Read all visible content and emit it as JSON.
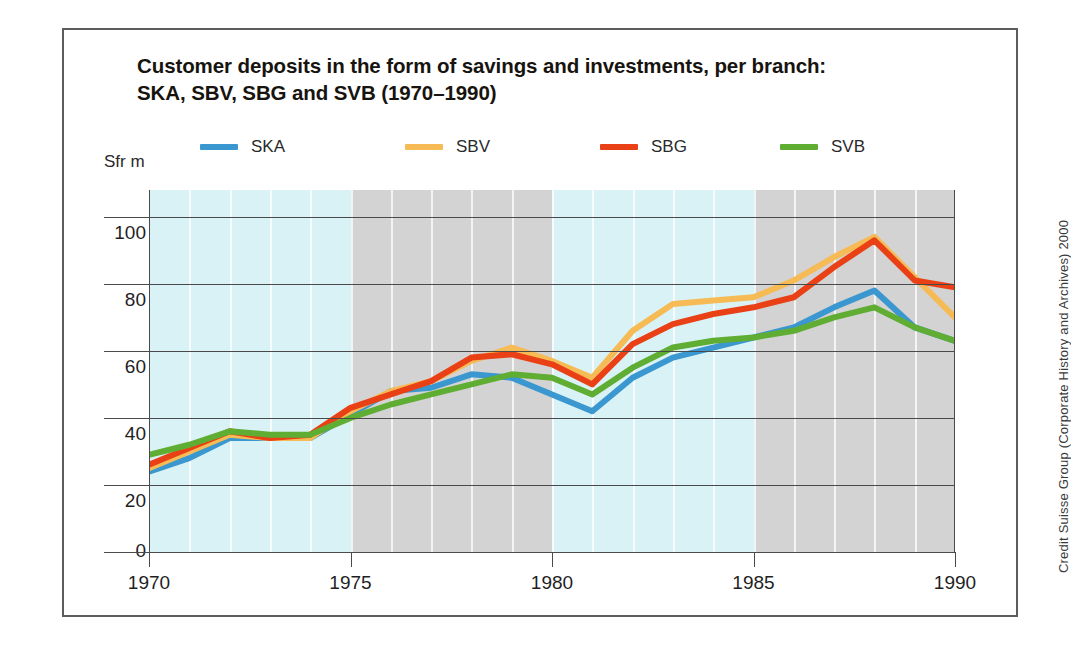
{
  "title": {
    "line1": "Customer deposits in the form of savings and investments, per branch:",
    "line2": "SKA, SBV, SBG and SVB (1970–1990)"
  },
  "axis": {
    "unit_label": "Sfr m",
    "y_ticks": [
      "100",
      "80",
      "60",
      "40",
      "20",
      "0"
    ],
    "x_ticks": [
      "1970",
      "1975",
      "1980",
      "1985",
      "1990"
    ]
  },
  "legend": [
    {
      "label": "SKA",
      "color": "#3b97cf"
    },
    {
      "label": "SBV",
      "color": "#f6bb54"
    },
    {
      "label": "SBG",
      "color": "#ea4016"
    },
    {
      "label": "SVB",
      "color": "#5fad33"
    }
  ],
  "credit": "Credit Suisse Group (Corporate History and Archives) 2000",
  "colors": {
    "plot_background": "#d9f2f5",
    "band_shading": "#d3d3d3",
    "gridline": "#4a4a4a",
    "frame": "#5d5d5d",
    "text": "#1f1f1f"
  },
  "chart_data": {
    "type": "line",
    "title": "Customer deposits in the form of savings and investments, per branch: SKA, SBV, SBG and SVB (1970–1990)",
    "xlabel": "",
    "ylabel": "Sfr m",
    "xlim": [
      1970,
      1990
    ],
    "ylim": [
      0,
      108
    ],
    "grid": true,
    "legend_position": "top",
    "x": [
      1970,
      1971,
      1972,
      1973,
      1974,
      1975,
      1976,
      1977,
      1978,
      1979,
      1980,
      1981,
      1982,
      1983,
      1984,
      1985,
      1986,
      1987,
      1988,
      1989,
      1990
    ],
    "shaded_bands": [
      [
        1975,
        1980
      ],
      [
        1985,
        1990
      ]
    ],
    "series": [
      {
        "name": "SKA",
        "color": "#3b97cf",
        "values": [
          24,
          28,
          34,
          34,
          34,
          41,
          48,
          49,
          53,
          52,
          47,
          42,
          52,
          58,
          61,
          64,
          67,
          73,
          78,
          67,
          63
        ]
      },
      {
        "name": "SBV",
        "color": "#f6bb54",
        "values": [
          25,
          30,
          35,
          34,
          34,
          42,
          48,
          51,
          57,
          61,
          57,
          52,
          66,
          74,
          75,
          76,
          81,
          88,
          94,
          82,
          70
        ]
      },
      {
        "name": "SBG",
        "color": "#ea4016",
        "values": [
          26,
          31,
          36,
          34,
          35,
          43,
          47,
          51,
          58,
          59,
          56,
          50,
          62,
          68,
          71,
          73,
          76,
          85,
          93,
          81,
          79
        ]
      },
      {
        "name": "SVB",
        "color": "#5fad33",
        "values": [
          29,
          32,
          36,
          35,
          35,
          40,
          44,
          47,
          50,
          53,
          52,
          47,
          55,
          61,
          63,
          64,
          66,
          70,
          73,
          67,
          63
        ]
      }
    ]
  }
}
